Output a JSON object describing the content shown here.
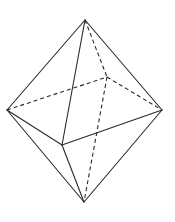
{
  "figure": {
    "stroke_color": "#2a2a2a",
    "background": "#ffffff",
    "vertices": {
      "top": [
        85,
        20
      ],
      "left": [
        7,
        110
      ],
      "right": [
        162,
        110
      ],
      "front": [
        62,
        145
      ],
      "back": [
        107,
        77
      ],
      "bottom": [
        84,
        202
      ]
    },
    "visible_edges": [
      [
        "top",
        "left"
      ],
      [
        "top",
        "right"
      ],
      [
        "top",
        "front"
      ],
      [
        "left",
        "front"
      ],
      [
        "front",
        "right"
      ],
      [
        "left",
        "bottom"
      ],
      [
        "front",
        "bottom"
      ],
      [
        "right",
        "bottom"
      ]
    ],
    "hidden_edges": [
      [
        "top",
        "back"
      ],
      [
        "left",
        "back"
      ],
      [
        "back",
        "right"
      ],
      [
        "back",
        "bottom"
      ]
    ]
  }
}
